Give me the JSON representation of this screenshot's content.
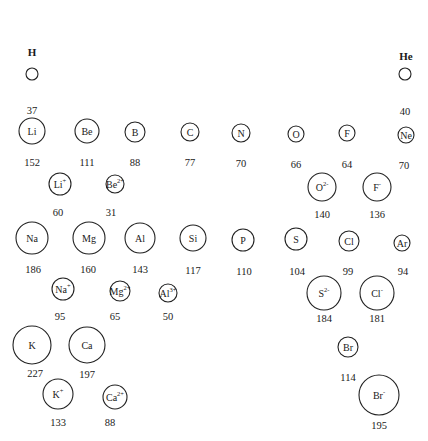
{
  "species": [
    {
      "id": "H",
      "symbol": "H",
      "charge": "",
      "radius": "37",
      "kind": "atom",
      "label_above": true
    },
    {
      "id": "He",
      "symbol": "He",
      "charge": "",
      "radius": "40",
      "kind": "atom",
      "label_above": true
    },
    {
      "id": "Li",
      "symbol": "Li",
      "charge": "",
      "radius": "152",
      "kind": "atom"
    },
    {
      "id": "Be",
      "symbol": "Be",
      "charge": "",
      "radius": "111",
      "kind": "atom"
    },
    {
      "id": "B",
      "symbol": "B",
      "charge": "",
      "radius": "88",
      "kind": "atom"
    },
    {
      "id": "C",
      "symbol": "C",
      "charge": "",
      "radius": "77",
      "kind": "atom"
    },
    {
      "id": "N",
      "symbol": "N",
      "charge": "",
      "radius": "70",
      "kind": "atom"
    },
    {
      "id": "O",
      "symbol": "O",
      "charge": "",
      "radius": "66",
      "kind": "atom"
    },
    {
      "id": "F",
      "symbol": "F",
      "charge": "",
      "radius": "64",
      "kind": "atom"
    },
    {
      "id": "Ne",
      "symbol": "Ne",
      "charge": "",
      "radius": "70",
      "kind": "atom"
    },
    {
      "id": "Li+",
      "symbol": "Li",
      "charge": "+",
      "radius": "60",
      "kind": "ion"
    },
    {
      "id": "Be2+",
      "symbol": "Be",
      "charge": "2+",
      "radius": "31",
      "kind": "ion"
    },
    {
      "id": "O2-",
      "symbol": "O",
      "charge": "2-",
      "radius": "140",
      "kind": "ion"
    },
    {
      "id": "F-",
      "symbol": "F",
      "charge": "-",
      "radius": "136",
      "kind": "ion"
    },
    {
      "id": "Na",
      "symbol": "Na",
      "charge": "",
      "radius": "186",
      "kind": "atom"
    },
    {
      "id": "Mg",
      "symbol": "Mg",
      "charge": "",
      "radius": "160",
      "kind": "atom"
    },
    {
      "id": "Al",
      "symbol": "Al",
      "charge": "",
      "radius": "143",
      "kind": "atom"
    },
    {
      "id": "Si",
      "symbol": "Si",
      "charge": "",
      "radius": "117",
      "kind": "atom"
    },
    {
      "id": "P",
      "symbol": "P",
      "charge": "",
      "radius": "110",
      "kind": "atom"
    },
    {
      "id": "S",
      "symbol": "S",
      "charge": "",
      "radius": "104",
      "kind": "atom"
    },
    {
      "id": "Cl",
      "symbol": "Cl",
      "charge": "",
      "radius": "99",
      "kind": "atom"
    },
    {
      "id": "Ar",
      "symbol": "Ar",
      "charge": "",
      "radius": "94",
      "kind": "atom"
    },
    {
      "id": "Na+",
      "symbol": "Na",
      "charge": "+",
      "radius": "95",
      "kind": "ion"
    },
    {
      "id": "Mg2+",
      "symbol": "Mg",
      "charge": "2+",
      "radius": "65",
      "kind": "ion"
    },
    {
      "id": "Al3+",
      "symbol": "Al",
      "charge": "3+",
      "radius": "50",
      "kind": "ion"
    },
    {
      "id": "S2-",
      "symbol": "S",
      "charge": "2-",
      "radius": "184",
      "kind": "ion"
    },
    {
      "id": "Cl-",
      "symbol": "Cl",
      "charge": "-",
      "radius": "181",
      "kind": "ion"
    },
    {
      "id": "K",
      "symbol": "K",
      "charge": "",
      "radius": "227",
      "kind": "atom"
    },
    {
      "id": "Ca",
      "symbol": "Ca",
      "charge": "",
      "radius": "197",
      "kind": "atom"
    },
    {
      "id": "K+",
      "symbol": "K",
      "charge": "+",
      "radius": "133",
      "kind": "ion"
    },
    {
      "id": "Ca2+",
      "symbol": "Ca",
      "charge": "2+",
      "radius": "88",
      "kind": "ion"
    },
    {
      "id": "Br",
      "symbol": "Br",
      "charge": "",
      "radius": "114",
      "kind": "atom"
    },
    {
      "id": "Br-",
      "symbol": "Br",
      "charge": "-",
      "radius": "195",
      "kind": "ion"
    }
  ]
}
